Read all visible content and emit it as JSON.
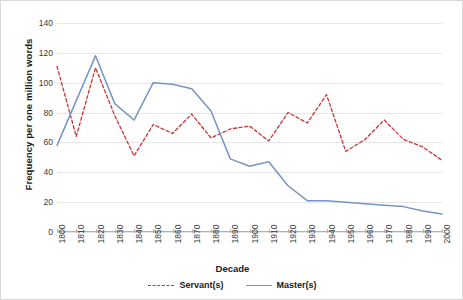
{
  "chart_data": {
    "type": "line",
    "title": "",
    "xlabel": "Decade",
    "ylabel": "Frequency per one million words",
    "x": [
      1800,
      1810,
      1820,
      1830,
      1840,
      1850,
      1860,
      1870,
      1880,
      1890,
      1900,
      1910,
      1920,
      1930,
      1940,
      1950,
      1960,
      1970,
      1980,
      1990,
      2000
    ],
    "categories": [
      "1800",
      "1810",
      "1820",
      "1830",
      "1840",
      "1850",
      "1860",
      "1870",
      "1880",
      "1890",
      "1900",
      "1910",
      "1920",
      "1930",
      "1940",
      "1950",
      "1960",
      "1970",
      "1980",
      "1990",
      "2000"
    ],
    "series": [
      {
        "name": "Servant(s)",
        "color": "#cc3333",
        "style": "dashed",
        "values": [
          111,
          64,
          110,
          78,
          51,
          72,
          66,
          79,
          63,
          69,
          71,
          61,
          80,
          73,
          92,
          54,
          62,
          75,
          62,
          57,
          48
        ]
      },
      {
        "name": "Master(s)",
        "color": "#7596c4",
        "style": "solid",
        "values": [
          58,
          88,
          118,
          86,
          75,
          100,
          99,
          96,
          81,
          49,
          44,
          47,
          31,
          21,
          21,
          20,
          19,
          18,
          17,
          14,
          12
        ]
      }
    ],
    "ylim": [
      0,
      140
    ],
    "yticks": [
      0,
      20,
      40,
      60,
      80,
      100,
      120,
      140
    ],
    "xlim": [
      1800,
      2000
    ],
    "grid": "horizontal",
    "legend_position": "bottom"
  },
  "axes": {
    "y_title": "Frequency per one million words",
    "x_title": "Decade"
  },
  "legend": {
    "entries": [
      {
        "label": "Servant(s)"
      },
      {
        "label": "Master(s)"
      }
    ]
  },
  "colors": {
    "servant": "#cc3333",
    "master": "#7596c4",
    "grid": "#e6e6e6",
    "axis": "#b0b0b0",
    "text": "#3a3a3a",
    "background": "#ffffff"
  }
}
